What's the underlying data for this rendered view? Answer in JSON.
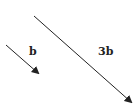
{
  "diagram": {
    "vectors": [
      {
        "label": "b",
        "from": [
          6,
          45
        ],
        "to": [
          40,
          75
        ],
        "color": "#222222"
      },
      {
        "label": "3b",
        "from": [
          34,
          16
        ],
        "to": [
          133,
          104
        ],
        "color": "#222222"
      }
    ],
    "labels": {
      "short_vector": "b",
      "long_vector": "3b"
    }
  }
}
